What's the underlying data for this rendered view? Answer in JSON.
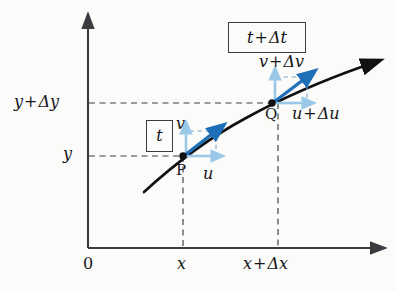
{
  "figure": {
    "background_color": "#fbfbf9",
    "axis_color": "#3a3a3f",
    "curve_color": "#111114",
    "dashed_color": "#3f3f44",
    "vector_color_dark": "#1f6fb8",
    "vector_color_light": "#9cc8e8",
    "box_border_color": "#3b3b40"
  },
  "axes": {
    "origin_label": "0",
    "x_axis_name": "x-axis",
    "y_axis_name": "y-axis",
    "x_ticks": [
      {
        "label_plain": "x",
        "value": "x"
      },
      {
        "label_plain": "x + Δx",
        "lead": "x",
        "op": "+",
        "tail": "Δx"
      }
    ],
    "y_ticks": [
      {
        "label_plain": "y",
        "value": "y"
      },
      {
        "label_plain": "y + Δy",
        "lead": "y",
        "op": "+",
        "tail": "Δy"
      }
    ]
  },
  "points": [
    {
      "name": "P",
      "label": "P",
      "time_box": "t",
      "vertical_component": "v",
      "horizontal_component": "u"
    },
    {
      "name": "Q",
      "label": "Q",
      "time_box_lead": "t",
      "time_box_op": "+",
      "time_box_tail": "Δt",
      "time_box_plain": "t + Δt",
      "vertical_component_lead": "v",
      "vertical_component_op": "+",
      "vertical_component_tail": "Δv",
      "vertical_component_plain": "v + Δv",
      "horizontal_component_lead": "u",
      "horizontal_component_op": "+",
      "horizontal_component_tail": "Δu",
      "horizontal_component_plain": "u + Δu"
    }
  ],
  "labels": {
    "y_dy_lead": "y",
    "y_dy_op": "+",
    "y_dy_tail": "Δy",
    "y": "y",
    "origin": "0",
    "x": "x",
    "x_dx_lead": "x",
    "x_dx_op": "+",
    "x_dx_tail": "Δx",
    "v_dv_lead": "v",
    "v_dv_op": "+",
    "v_dv_tail": "Δv",
    "u_du_lead": "u",
    "u_du_op": "+",
    "u_du_tail": "Δu",
    "v": "v",
    "u": "u",
    "P": "P",
    "Q": "Q",
    "box_t": "t",
    "box_t_dt_lead": "t",
    "box_t_dt_op": "+",
    "box_t_dt_tail": "Δt"
  }
}
